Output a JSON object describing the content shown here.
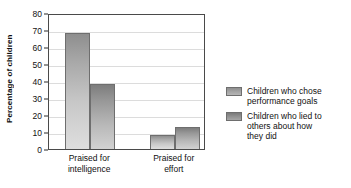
{
  "chart_data": {
    "type": "bar",
    "title": "",
    "xlabel": "",
    "ylabel": "Percentage of children",
    "categories": [
      "Praised for intelligence",
      "Praised for effort"
    ],
    "category_lines": [
      [
        "Praised for",
        "intelligence"
      ],
      [
        "Praised for",
        "effort"
      ]
    ],
    "series": [
      {
        "name": "Children who chose performance goals",
        "name_lines": [
          "Children who chose",
          "performance goals"
        ],
        "values": [
          68,
          8
        ],
        "color": "#a9a9a9"
      },
      {
        "name": "Children who lied to others about how they did",
        "name_lines": [
          "Children who lied to",
          "others about how",
          "they did"
        ],
        "values": [
          38,
          13
        ],
        "color": "#989898"
      }
    ],
    "ylim": [
      0,
      80
    ],
    "yticks": [
      0,
      10,
      20,
      30,
      40,
      50,
      60,
      70,
      80
    ],
    "ytick_labels": [
      "0",
      "10",
      "20",
      "30",
      "40",
      "50",
      "60",
      "70",
      "80"
    ],
    "grid": true,
    "legend_position": "right"
  }
}
